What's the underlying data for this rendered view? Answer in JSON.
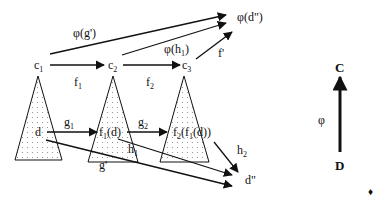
{
  "diagram": {
    "nodes": {
      "c1": {
        "base": "c",
        "sub": "1"
      },
      "c2": {
        "base": "c",
        "sub": "2"
      },
      "c3": {
        "base": "c",
        "sub": "3"
      },
      "phi_d2": "φ(d\")",
      "d": "d",
      "f1d": {
        "a": "f",
        "a_sub": "1",
        "b": "(d)"
      },
      "f2f1d": {
        "a": "f",
        "a_sub": "2",
        "b": "(f",
        "b_sub": "1",
        "c": "(d))"
      },
      "d2": "d\"",
      "C": "C",
      "D": "D"
    },
    "edges": {
      "f1": {
        "base": "f",
        "sub": "1"
      },
      "f2": {
        "base": "f",
        "sub": "2"
      },
      "phi_g": "φ(g')",
      "phi_h1": {
        "a": "φ(h",
        "sub": "1",
        "b": ")"
      },
      "fprime": "f'",
      "g1": {
        "base": "g",
        "sub": "1"
      },
      "g2": {
        "base": "g",
        "sub": "2"
      },
      "h1": {
        "base": "h",
        "sub": "1"
      },
      "h2": {
        "base": "h",
        "sub": "2"
      },
      "gprime": "g'",
      "phi": "φ"
    },
    "end_mark": "♦",
    "colors": {
      "ink": "#111111",
      "dots": "#888888",
      "background": "#ffffff"
    }
  }
}
